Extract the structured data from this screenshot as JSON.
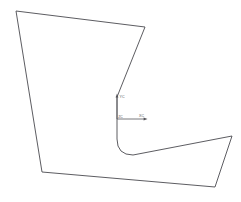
{
  "drawing": {
    "title": "2D profile sketch with curved notch",
    "background_color": "#ffffff",
    "line_color": "#4a4a4f",
    "line_width": 0.9,
    "width": 241,
    "height": 202
  },
  "profile": {
    "name": "closed-profile-outline",
    "description": "Closed polygon with a U-shaped curved slot cut in from the upper right toward the center",
    "path": "M 16 11 L 145 27 L 117 97 L 117 139 Q 117 155 133 155 L 232 136 L 215 187 L 42 172 Z",
    "vertices": [
      {
        "name": "top-left",
        "x": 16,
        "y": 11
      },
      {
        "name": "top-right",
        "x": 145,
        "y": 27
      },
      {
        "name": "notch-entry",
        "x": 117,
        "y": 97
      },
      {
        "name": "notch-left-wall-bottom",
        "x": 117,
        "y": 139
      },
      {
        "name": "notch-arc-end",
        "x": 133,
        "y": 155
      },
      {
        "name": "right-upper",
        "x": 232,
        "y": 136
      },
      {
        "name": "right-lower",
        "x": 215,
        "y": 187
      },
      {
        "name": "bottom-left",
        "x": 42,
        "y": 172
      }
    ]
  },
  "coordinate_marker": {
    "name": "coordinate-system-indicator",
    "origin": {
      "x": 117,
      "y": 119
    },
    "color": "#55555a",
    "vertical_axis": {
      "label": "YC",
      "from": {
        "x": 117,
        "y": 119
      },
      "to": {
        "x": 117,
        "y": 95
      }
    },
    "horizontal_axis": {
      "label": "XC",
      "from": {
        "x": 117,
        "y": 119
      },
      "to": {
        "x": 148,
        "y": 119
      }
    },
    "origin_label": "ZC"
  }
}
